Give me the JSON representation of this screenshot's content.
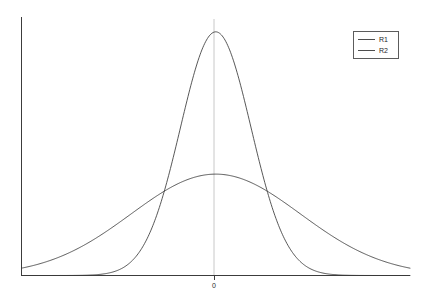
{
  "chart_data": {
    "type": "line",
    "title": "",
    "subtitle": "",
    "xlabel": "",
    "ylabel": "",
    "xlim": [
      -5.5,
      5.5
    ],
    "ylim": [
      0,
      0.42
    ],
    "grid": false,
    "legend_position": "top-right",
    "x_tick_labels": [
      "0"
    ],
    "x_tick_values": [
      0
    ],
    "y_tick_labels": [],
    "annotations": [],
    "series": [
      {
        "name": "R1",
        "kind": "normal-density",
        "mean": 0,
        "sigma": 1.0,
        "peak_value": 0.399,
        "color": "#3a3a3a",
        "x": [
          -5.5,
          -5.0,
          -4.5,
          -4.0,
          -3.5,
          -3.0,
          -2.5,
          -2.0,
          -1.5,
          -1.0,
          -0.5,
          0.0,
          0.5,
          1.0,
          1.5,
          2.0,
          2.5,
          3.0,
          3.5,
          4.0,
          4.5,
          5.0,
          5.5
        ],
        "values": [
          0.0,
          0.0,
          0.0,
          0.0001,
          0.0009,
          0.0044,
          0.0175,
          0.054,
          0.1295,
          0.242,
          0.3521,
          0.3989,
          0.3521,
          0.242,
          0.1295,
          0.054,
          0.0175,
          0.0044,
          0.0009,
          0.0001,
          0.0,
          0.0,
          0.0
        ]
      },
      {
        "name": "R2",
        "kind": "normal-density",
        "mean": 0,
        "sigma": 2.4,
        "peak_value": 0.166,
        "color": "#3a3a3a",
        "x": [
          -5.5,
          -5.0,
          -4.5,
          -4.0,
          -3.5,
          -3.0,
          -2.5,
          -2.0,
          -1.5,
          -1.0,
          -0.5,
          0.0,
          0.5,
          1.0,
          1.5,
          2.0,
          2.5,
          3.0,
          3.5,
          4.0,
          4.5,
          5.0,
          5.5
        ],
        "values": [
          0.0095,
          0.0156,
          0.0242,
          0.0354,
          0.0489,
          0.0639,
          0.0789,
          0.0924,
          0.1025,
          0.1078,
          0.1077,
          0.1662,
          0.1077,
          0.1078,
          0.1025,
          0.0924,
          0.0789,
          0.0639,
          0.0489,
          0.0354,
          0.0242,
          0.0156,
          0.0095
        ]
      }
    ],
    "crossings": [
      {
        "x": -1.45,
        "note": "left intersection of R1 and R2"
      },
      {
        "x": 1.45,
        "note": "right intersection of R1 and R2"
      }
    ]
  },
  "legend": {
    "entries": [
      {
        "label": "R1",
        "color": "#3a3a3a"
      },
      {
        "label": "R2",
        "color": "#3a3a3a"
      }
    ]
  },
  "axes": {
    "x_axis_label": "",
    "y_axis_label": "",
    "origin_tick_label": "0"
  },
  "colors": {
    "axis": "#3c3c3c",
    "curve": "#3a3a3a",
    "zero_guide": "#c8c8c8",
    "legend_border": "#4a4a4a",
    "background": "#ffffff",
    "text": "#1e1e1e"
  }
}
